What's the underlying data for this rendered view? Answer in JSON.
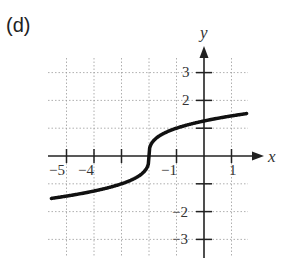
{
  "panel_label": "(d)",
  "chart_data": {
    "type": "line",
    "title": "",
    "function": "y = cbrt(x + 2)",
    "xlabel": "x",
    "ylabel": "y",
    "xlim": [
      -5.6,
      1.6
    ],
    "ylim": [
      -3.6,
      3.6
    ],
    "x_ticks": [
      -5,
      -4,
      -3,
      -2,
      -1,
      0,
      1
    ],
    "x_tick_labels": [
      "−5",
      "−4",
      "",
      "",
      "−1",
      "",
      "1"
    ],
    "y_ticks": [
      -3,
      -2,
      -1,
      1,
      2,
      3
    ],
    "y_tick_labels": [
      "−3",
      "−2",
      "",
      "",
      "2",
      "3"
    ],
    "grid": true,
    "grid_style": "dotted",
    "series": [
      {
        "name": "f(x)",
        "x": [
          -5.5,
          -5,
          -4,
          -3,
          -2.5,
          -2.1,
          -2,
          -1.9,
          -1.5,
          -1,
          0,
          1,
          1.5
        ],
        "y": [
          -1.52,
          -1.44,
          -1.26,
          -1.0,
          -0.79,
          -0.46,
          0,
          0.46,
          0.79,
          1.0,
          1.26,
          1.44,
          1.52
        ]
      }
    ],
    "colors": {
      "curve": "#111111",
      "axes": "#222222",
      "grid": "#9a9a9a"
    }
  },
  "axis_labels": {
    "x": "x",
    "y": "y"
  },
  "tick_text": {
    "xm5": "−5",
    "xm4": "−4",
    "xm1": "−1",
    "x1": "1",
    "y3": "3",
    "y2": "2",
    "ym2": "−2",
    "ym3": "−3"
  }
}
